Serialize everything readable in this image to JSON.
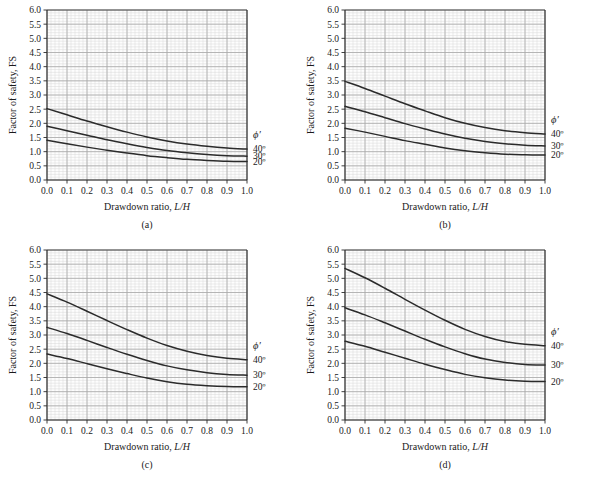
{
  "figure": {
    "panel_letters": [
      "(a)",
      "(b)",
      "(c)",
      "(d)"
    ],
    "bottom_caption_faint": "",
    "colors": {
      "curve": "#2b2b2b",
      "axis": "#2b2b2b",
      "grid_major": "#a8a8a8",
      "grid_minor": "#d8d8d8",
      "background": "#ffffff",
      "plot_background": "#fdfdfd"
    }
  },
  "axes": {
    "xlabel_text": "Drawdown ratio, ",
    "xlabel_italic": "L/H",
    "ylabel": "Factor of safety, FS",
    "xticks": [
      "0.0",
      "0.1",
      "0.2",
      "0.3",
      "0.4",
      "0.5",
      "0.6",
      "0.7",
      "0.8",
      "0.9",
      "1.0"
    ],
    "yticks": [
      "0.0",
      "0.5",
      "1.0",
      "1.5",
      "2.0",
      "2.5",
      "3.0",
      "3.5",
      "4.0",
      "4.5",
      "5.0",
      "5.5",
      "6.0"
    ],
    "xlim": [
      0.0,
      1.0
    ],
    "ylim": [
      0.0,
      6.0
    ],
    "xmajor_step": 0.1,
    "ymajor_step": 0.5,
    "xminor_divisions": 5,
    "yminor_divisions": 5,
    "grid": true
  },
  "legend": {
    "title": "ϕ′",
    "entries": [
      "40º",
      "30º",
      "20º"
    ],
    "position": "right-outside"
  },
  "chart_data": [
    {
      "type": "line",
      "panel": "(a)",
      "title": "",
      "xlabel": "Drawdown ratio, L/H",
      "ylabel": "Factor of safety, FS",
      "xlim": [
        0.0,
        1.0
      ],
      "ylim": [
        0.0,
        6.0
      ],
      "grid": true,
      "legend_title": "ϕ′",
      "x": [
        0.0,
        0.1,
        0.2,
        0.3,
        0.4,
        0.5,
        0.6,
        0.7,
        0.8,
        0.9,
        1.0
      ],
      "series": [
        {
          "name": "40º",
          "values": [
            2.52,
            2.3,
            2.08,
            1.88,
            1.69,
            1.52,
            1.38,
            1.27,
            1.19,
            1.13,
            1.09
          ]
        },
        {
          "name": "30º",
          "values": [
            1.9,
            1.74,
            1.58,
            1.42,
            1.28,
            1.15,
            1.04,
            0.96,
            0.9,
            0.86,
            0.84
          ]
        },
        {
          "name": "20º",
          "values": [
            1.4,
            1.28,
            1.16,
            1.05,
            0.95,
            0.86,
            0.79,
            0.73,
            0.69,
            0.66,
            0.65
          ]
        }
      ]
    },
    {
      "type": "line",
      "panel": "(b)",
      "title": "",
      "xlabel": "Drawdown ratio, L/H",
      "ylabel": "Factor of safety, FS",
      "xlim": [
        0.0,
        1.0
      ],
      "ylim": [
        0.0,
        6.0
      ],
      "grid": true,
      "legend_title": "ϕ′",
      "x": [
        0.0,
        0.1,
        0.2,
        0.3,
        0.4,
        0.5,
        0.6,
        0.7,
        0.8,
        0.9,
        1.0
      ],
      "series": [
        {
          "name": "40º",
          "values": [
            3.48,
            3.23,
            2.96,
            2.69,
            2.44,
            2.2,
            2.0,
            1.85,
            1.74,
            1.67,
            1.62
          ]
        },
        {
          "name": "30º",
          "values": [
            2.6,
            2.41,
            2.2,
            1.99,
            1.8,
            1.62,
            1.47,
            1.36,
            1.28,
            1.23,
            1.2
          ]
        },
        {
          "name": "20º",
          "values": [
            1.83,
            1.69,
            1.54,
            1.39,
            1.26,
            1.13,
            1.03,
            0.96,
            0.91,
            0.89,
            0.88
          ]
        }
      ]
    },
    {
      "type": "line",
      "panel": "(c)",
      "title": "",
      "xlabel": "Drawdown ratio, L/H",
      "ylabel": "Factor of safety, FS",
      "xlim": [
        0.0,
        1.0
      ],
      "ylim": [
        0.0,
        6.0
      ],
      "grid": true,
      "legend_title": "ϕ′",
      "x": [
        0.0,
        0.1,
        0.2,
        0.3,
        0.4,
        0.5,
        0.6,
        0.7,
        0.8,
        0.9,
        1.0
      ],
      "series": [
        {
          "name": "40º",
          "values": [
            4.45,
            4.16,
            3.84,
            3.51,
            3.19,
            2.89,
            2.63,
            2.43,
            2.28,
            2.18,
            2.13
          ]
        },
        {
          "name": "30º",
          "values": [
            3.27,
            3.05,
            2.81,
            2.56,
            2.32,
            2.1,
            1.91,
            1.77,
            1.67,
            1.61,
            1.58
          ]
        },
        {
          "name": "20º",
          "values": [
            2.33,
            2.17,
            1.99,
            1.81,
            1.64,
            1.48,
            1.35,
            1.26,
            1.21,
            1.18,
            1.17
          ]
        }
      ]
    },
    {
      "type": "line",
      "panel": "(d)",
      "title": "",
      "xlabel": "Drawdown ratio, L/H",
      "ylabel": "Factor of safety, FS",
      "xlim": [
        0.0,
        1.0
      ],
      "ylim": [
        0.0,
        6.0
      ],
      "grid": true,
      "legend_title": "ϕ′",
      "x": [
        0.0,
        0.1,
        0.2,
        0.3,
        0.4,
        0.5,
        0.6,
        0.7,
        0.8,
        0.9,
        1.0
      ],
      "series": [
        {
          "name": "40º",
          "values": [
            5.35,
            5.02,
            4.65,
            4.26,
            3.88,
            3.52,
            3.2,
            2.95,
            2.77,
            2.67,
            2.62
          ]
        },
        {
          "name": "30º",
          "values": [
            3.96,
            3.71,
            3.43,
            3.14,
            2.85,
            2.58,
            2.34,
            2.15,
            2.03,
            1.96,
            1.94
          ]
        },
        {
          "name": "20º",
          "values": [
            2.78,
            2.6,
            2.39,
            2.18,
            1.97,
            1.78,
            1.61,
            1.49,
            1.41,
            1.37,
            1.36
          ]
        }
      ]
    }
  ]
}
